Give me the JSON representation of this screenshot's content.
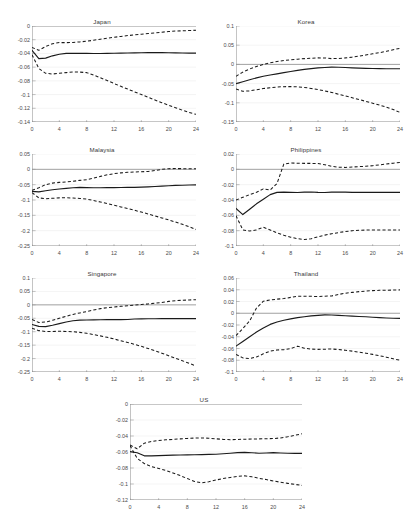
{
  "figure": {
    "layout": "3 rows of 2 panels plus 1 centered panel",
    "xlabel": "",
    "ylabel": "",
    "xticks": [
      0,
      4,
      8,
      12,
      16,
      20,
      24
    ],
    "xtick_labels": [
      "0",
      "4",
      "8",
      "12",
      "16",
      "20",
      "24"
    ],
    "line_styles": {
      "response": "solid",
      "confidence_bands": "dashed"
    },
    "colors": {
      "line": "#1a1a1a",
      "axis": "#7f7f7f",
      "grid": "#e9e9e9",
      "text": "#4a4a4a",
      "background": "#ffffff"
    }
  },
  "chart_data": [
    {
      "type": "line",
      "title": "Japan",
      "xlabel": "",
      "ylabel": "",
      "xlim": [
        0,
        24
      ],
      "ylim": [
        -0.14,
        0
      ],
      "yticks": [
        0,
        -0.02,
        -0.04,
        -0.06,
        -0.08,
        -0.1,
        -0.12,
        -0.14
      ],
      "ytick_labels": [
        "0",
        "-0.02",
        "-0.04",
        "-0.06",
        "-0.08",
        "-0.1",
        "-0.12",
        "-0.14"
      ],
      "grid": true,
      "legend": "none",
      "x": [
        0,
        1,
        2,
        3,
        4,
        5,
        6,
        7,
        8,
        9,
        10,
        11,
        12,
        13,
        14,
        15,
        16,
        17,
        18,
        19,
        20,
        21,
        22,
        23,
        24
      ],
      "series": [
        {
          "name": "Response",
          "style": "solid",
          "values": [
            -0.0355,
            -0.0475,
            -0.0468,
            -0.0435,
            -0.0412,
            -0.04,
            -0.0398,
            -0.0399,
            -0.04,
            -0.0401,
            -0.0401,
            -0.04,
            -0.0398,
            -0.0396,
            -0.0394,
            -0.0392,
            -0.039,
            -0.0389,
            -0.0388,
            -0.0389,
            -0.039,
            -0.0392,
            -0.0394,
            -0.0396,
            -0.0396
          ]
        },
        {
          "name": "Upper band",
          "style": "dashed",
          "values": [
            -0.0312,
            -0.0355,
            -0.03,
            -0.0258,
            -0.0242,
            -0.0243,
            -0.024,
            -0.0232,
            -0.0222,
            -0.0208,
            -0.0192,
            -0.0178,
            -0.0165,
            -0.0152,
            -0.014,
            -0.013,
            -0.012,
            -0.011,
            -0.01,
            -0.009,
            -0.008,
            -0.0074,
            -0.007,
            -0.0066,
            -0.0063
          ]
        },
        {
          "name": "Lower band",
          "style": "dashed",
          "values": [
            -0.042,
            -0.062,
            -0.069,
            -0.07,
            -0.069,
            -0.068,
            -0.067,
            -0.0672,
            -0.068,
            -0.0715,
            -0.0755,
            -0.0795,
            -0.0838,
            -0.088,
            -0.092,
            -0.096,
            -0.1,
            -0.104,
            -0.108,
            -0.1118,
            -0.1155,
            -0.1192,
            -0.1228,
            -0.1262,
            -0.1288
          ]
        }
      ]
    },
    {
      "type": "line",
      "title": "Korea",
      "xlabel": "",
      "ylabel": "",
      "xlim": [
        0,
        24
      ],
      "ylim": [
        -0.15,
        0.1
      ],
      "yticks": [
        0.1,
        0.05,
        0,
        -0.05,
        -0.1,
        -0.15
      ],
      "ytick_labels": [
        "0.1",
        "0.05",
        "0",
        "-0.05",
        "-0.1",
        "-0.15"
      ],
      "grid": true,
      "legend": "none",
      "x": [
        0,
        1,
        2,
        3,
        4,
        5,
        6,
        7,
        8,
        9,
        10,
        11,
        12,
        13,
        14,
        15,
        16,
        17,
        18,
        19,
        20,
        21,
        22,
        23,
        24
      ],
      "series": [
        {
          "name": "Response",
          "style": "solid",
          "values": [
            -0.05,
            -0.045,
            -0.04,
            -0.035,
            -0.031,
            -0.0275,
            -0.0245,
            -0.0215,
            -0.0185,
            -0.0155,
            -0.013,
            -0.011,
            -0.0092,
            -0.008,
            -0.0072,
            -0.0075,
            -0.0082,
            -0.009,
            -0.0098,
            -0.0104,
            -0.0108,
            -0.011,
            -0.0112,
            -0.0113,
            -0.0114
          ]
        },
        {
          "name": "Upper band",
          "style": "dashed",
          "values": [
            -0.031,
            -0.02,
            -0.012,
            -0.0055,
            0.0,
            0.004,
            0.0075,
            0.01,
            0.012,
            0.0135,
            0.015,
            0.016,
            0.017,
            0.0168,
            0.015,
            0.0155,
            0.017,
            0.019,
            0.0215,
            0.0245,
            0.0275,
            0.0305,
            0.034,
            0.038,
            0.042
          ]
        },
        {
          "name": "Lower band",
          "style": "dashed",
          "values": [
            -0.064,
            -0.07,
            -0.069,
            -0.066,
            -0.063,
            -0.0608,
            -0.059,
            -0.058,
            -0.0578,
            -0.0585,
            -0.06,
            -0.0625,
            -0.0655,
            -0.069,
            -0.073,
            -0.0775,
            -0.082,
            -0.0868,
            -0.0915,
            -0.0962,
            -0.101,
            -0.106,
            -0.1112,
            -0.1175,
            -0.125
          ]
        }
      ]
    },
    {
      "type": "line",
      "title": "Malaysia",
      "xlabel": "",
      "ylabel": "",
      "xlim": [
        0,
        24
      ],
      "ylim": [
        -0.25,
        0.05
      ],
      "yticks": [
        0.05,
        0,
        -0.05,
        -0.1,
        -0.15,
        -0.2,
        -0.25
      ],
      "ytick_labels": [
        "0.05",
        "0",
        "-0.05",
        "-0.1",
        "-0.15",
        "-0.2",
        "-0.25"
      ],
      "grid": true,
      "legend": "none",
      "x": [
        0,
        1,
        2,
        3,
        4,
        5,
        6,
        7,
        8,
        9,
        10,
        11,
        12,
        13,
        14,
        15,
        16,
        17,
        18,
        19,
        20,
        21,
        22,
        23,
        24
      ],
      "series": [
        {
          "name": "Response",
          "style": "solid",
          "values": [
            -0.072,
            -0.0735,
            -0.07,
            -0.0665,
            -0.064,
            -0.062,
            -0.06,
            -0.059,
            -0.0595,
            -0.06,
            -0.06,
            -0.0598,
            -0.0595,
            -0.0592,
            -0.059,
            -0.0588,
            -0.0582,
            -0.0572,
            -0.056,
            -0.0548,
            -0.0535,
            -0.0525,
            -0.0518,
            -0.0512,
            -0.0508
          ]
        },
        {
          "name": "Upper band",
          "style": "dashed",
          "values": [
            -0.068,
            -0.06,
            -0.05,
            -0.045,
            -0.0425,
            -0.041,
            -0.039,
            -0.036,
            -0.034,
            -0.029,
            -0.023,
            -0.018,
            -0.014,
            -0.0115,
            -0.0098,
            -0.0085,
            -0.008,
            -0.0068,
            -0.004,
            0.0,
            0.0022,
            0.0024,
            0.0022,
            0.0022,
            0.0022
          ]
        },
        {
          "name": "Lower band",
          "style": "dashed",
          "values": [
            -0.076,
            -0.093,
            -0.096,
            -0.0945,
            -0.093,
            -0.0928,
            -0.0935,
            -0.095,
            -0.097,
            -0.1015,
            -0.1065,
            -0.1115,
            -0.117,
            -0.1225,
            -0.128,
            -0.1335,
            -0.1395,
            -0.1455,
            -0.152,
            -0.1585,
            -0.165,
            -0.1718,
            -0.179,
            -0.187,
            -0.196
          ]
        }
      ]
    },
    {
      "type": "line",
      "title": "Philippines",
      "xlabel": "",
      "ylabel": "",
      "xlim": [
        0,
        24
      ],
      "ylim": [
        -0.1,
        0.02
      ],
      "yticks": [
        0.02,
        0,
        -0.02,
        -0.04,
        -0.06,
        -0.08,
        -0.1
      ],
      "ytick_labels": [
        "0.02",
        "0",
        "-0.02",
        "-0.04",
        "-0.06",
        "-0.08",
        "-0.1"
      ],
      "grid": true,
      "legend": "none",
      "x": [
        0,
        1,
        2,
        3,
        4,
        5,
        6,
        7,
        8,
        9,
        10,
        11,
        12,
        13,
        14,
        15,
        16,
        17,
        18,
        19,
        20,
        21,
        22,
        23,
        24
      ],
      "series": [
        {
          "name": "Response",
          "style": "solid",
          "values": [
            -0.051,
            -0.059,
            -0.052,
            -0.045,
            -0.039,
            -0.033,
            -0.03,
            -0.0298,
            -0.03,
            -0.0302,
            -0.0298,
            -0.0295,
            -0.03,
            -0.0302,
            -0.0298,
            -0.0296,
            -0.0298,
            -0.03,
            -0.03,
            -0.03,
            -0.03,
            -0.03,
            -0.03,
            -0.03,
            -0.03
          ]
        },
        {
          "name": "Upper band",
          "style": "dashed",
          "values": [
            -0.04,
            -0.0365,
            -0.033,
            -0.03,
            -0.0255,
            -0.027,
            -0.0185,
            0.007,
            0.0082,
            0.008,
            0.0078,
            0.0078,
            0.0075,
            0.006,
            0.004,
            0.0028,
            0.0025,
            0.003,
            0.0035,
            0.004,
            0.0048,
            0.0058,
            0.007,
            0.008,
            0.009
          ]
        },
        {
          "name": "Lower band",
          "style": "dashed",
          "values": [
            -0.0605,
            -0.079,
            -0.0805,
            -0.079,
            -0.0755,
            -0.079,
            -0.083,
            -0.086,
            -0.0885,
            -0.0905,
            -0.0915,
            -0.0905,
            -0.088,
            -0.0858,
            -0.084,
            -0.0825,
            -0.0812,
            -0.08,
            -0.0795,
            -0.0792,
            -0.079,
            -0.079,
            -0.079,
            -0.079,
            -0.079
          ]
        }
      ]
    },
    {
      "type": "line",
      "title": "Singapore",
      "xlabel": "",
      "ylabel": "",
      "xlim": [
        0,
        24
      ],
      "ylim": [
        -0.25,
        0.1
      ],
      "yticks": [
        0.1,
        0.05,
        0,
        -0.05,
        -0.1,
        -0.15,
        -0.2,
        -0.25
      ],
      "ytick_labels": [
        "0.1",
        "0.05",
        "0",
        "-0.05",
        "-0.1",
        "-0.15",
        "-0.2",
        "-0.25"
      ],
      "grid": true,
      "legend": "none",
      "x": [
        0,
        1,
        2,
        3,
        4,
        5,
        6,
        7,
        8,
        9,
        10,
        11,
        12,
        13,
        14,
        15,
        16,
        17,
        18,
        19,
        20,
        21,
        22,
        23,
        24
      ],
      "series": [
        {
          "name": "Response",
          "style": "solid",
          "values": [
            -0.073,
            -0.08,
            -0.081,
            -0.076,
            -0.07,
            -0.064,
            -0.059,
            -0.057,
            -0.0562,
            -0.0558,
            -0.0555,
            -0.0552,
            -0.055,
            -0.0548,
            -0.0545,
            -0.0525,
            -0.052,
            -0.0518,
            -0.0516,
            -0.0514,
            -0.0512,
            -0.051,
            -0.051,
            -0.051,
            -0.051
          ]
        },
        {
          "name": "Upper band",
          "style": "dashed",
          "values": [
            -0.054,
            -0.066,
            -0.064,
            -0.0575,
            -0.05,
            -0.0425,
            -0.0355,
            -0.03,
            -0.025,
            -0.019,
            -0.014,
            -0.0105,
            -0.0078,
            -0.0055,
            -0.0035,
            -0.0012,
            0.001,
            0.0035,
            0.006,
            0.0085,
            0.013,
            0.0155,
            0.017,
            0.0182,
            0.0192
          ]
        },
        {
          "name": "Lower band",
          "style": "dashed",
          "values": [
            -0.087,
            -0.096,
            -0.0995,
            -0.099,
            -0.0985,
            -0.099,
            -0.1,
            -0.1025,
            -0.106,
            -0.1105,
            -0.1155,
            -0.121,
            -0.127,
            -0.1335,
            -0.14,
            -0.147,
            -0.1545,
            -0.1625,
            -0.171,
            -0.18,
            -0.1895,
            -0.199,
            -0.208,
            -0.2175,
            -0.2275
          ]
        }
      ]
    },
    {
      "type": "line",
      "title": "Thailand",
      "xlabel": "",
      "ylabel": "",
      "xlim": [
        -0.1,
        0.06
      ],
      "ylim": [
        -0.1,
        0.06
      ],
      "yticks": [
        0.06,
        0.04,
        0.02,
        0,
        -0.02,
        -0.04,
        -0.06,
        -0.08,
        -0.1
      ],
      "ytick_labels": [
        "0.06",
        "0.04",
        "0.02",
        "0",
        "-0.02",
        "-0.04",
        "-0.06",
        "-0.08",
        "-0.1"
      ],
      "grid": true,
      "legend": "none",
      "x": [
        0,
        1,
        2,
        3,
        4,
        5,
        6,
        7,
        8,
        9,
        10,
        11,
        12,
        13,
        14,
        15,
        16,
        17,
        18,
        19,
        20,
        21,
        22,
        23,
        24
      ],
      "series": [
        {
          "name": "Response",
          "style": "solid",
          "values": [
            -0.056,
            -0.048,
            -0.04,
            -0.032,
            -0.025,
            -0.019,
            -0.015,
            -0.012,
            -0.0095,
            -0.0075,
            -0.006,
            -0.0045,
            -0.0035,
            -0.0028,
            -0.003,
            -0.0035,
            -0.0042,
            -0.0048,
            -0.0055,
            -0.006,
            -0.0068,
            -0.0075,
            -0.008,
            -0.0085,
            -0.0088
          ]
        },
        {
          "name": "Upper band",
          "style": "dashed",
          "values": [
            -0.038,
            -0.026,
            -0.013,
            0.009,
            0.0205,
            0.0225,
            0.024,
            0.025,
            0.027,
            0.0288,
            0.029,
            0.0288,
            0.0285,
            0.029,
            0.0295,
            0.032,
            0.034,
            0.0355,
            0.0368,
            0.0378,
            0.0385,
            0.039,
            0.0392,
            0.0395,
            0.0398
          ]
        },
        {
          "name": "Lower band",
          "style": "dashed",
          "values": [
            -0.07,
            -0.076,
            -0.0772,
            -0.0745,
            -0.069,
            -0.0645,
            -0.0625,
            -0.062,
            -0.06,
            -0.056,
            -0.0595,
            -0.061,
            -0.0615,
            -0.0612,
            -0.0608,
            -0.0618,
            -0.063,
            -0.0645,
            -0.0662,
            -0.068,
            -0.07,
            -0.0722,
            -0.0748,
            -0.0775,
            -0.08
          ]
        }
      ]
    },
    {
      "type": "line",
      "title": "US",
      "xlabel": "",
      "ylabel": "",
      "xlim": [
        0,
        24
      ],
      "ylim": [
        -0.12,
        0
      ],
      "yticks": [
        0,
        -0.02,
        -0.04,
        -0.06,
        -0.08,
        -0.1,
        -0.12
      ],
      "ytick_labels": [
        "0",
        "-0.02",
        "-0.04",
        "-0.06",
        "-0.08",
        "-0.1",
        "-0.12"
      ],
      "grid": true,
      "legend": "none",
      "x": [
        0,
        1,
        2,
        3,
        4,
        5,
        6,
        7,
        8,
        9,
        10,
        11,
        12,
        13,
        14,
        15,
        16,
        17,
        18,
        19,
        20,
        21,
        22,
        23,
        24
      ],
      "series": [
        {
          "name": "Response",
          "style": "solid",
          "values": [
            -0.0595,
            -0.061,
            -0.0648,
            -0.0648,
            -0.0645,
            -0.0642,
            -0.064,
            -0.0638,
            -0.0636,
            -0.0634,
            -0.0632,
            -0.063,
            -0.0628,
            -0.0622,
            -0.0615,
            -0.0608,
            -0.0605,
            -0.061,
            -0.0615,
            -0.0612,
            -0.0608,
            -0.0612,
            -0.0616,
            -0.0618,
            -0.0618
          ]
        },
        {
          "name": "Upper band",
          "style": "dashed",
          "values": [
            -0.0512,
            -0.056,
            -0.049,
            -0.0468,
            -0.0455,
            -0.0448,
            -0.0442,
            -0.0436,
            -0.043,
            -0.0426,
            -0.0424,
            -0.0428,
            -0.0435,
            -0.0442,
            -0.0446,
            -0.0443,
            -0.044,
            -0.0438,
            -0.0436,
            -0.0434,
            -0.0432,
            -0.0424,
            -0.041,
            -0.0392,
            -0.0372
          ]
        },
        {
          "name": "Lower band",
          "style": "dashed",
          "values": [
            -0.052,
            -0.068,
            -0.0745,
            -0.0782,
            -0.0805,
            -0.0832,
            -0.0862,
            -0.0895,
            -0.0932,
            -0.0968,
            -0.0985,
            -0.0972,
            -0.095,
            -0.0932,
            -0.0918,
            -0.0905,
            -0.0898,
            -0.091,
            -0.0928,
            -0.0945,
            -0.0962,
            -0.0978,
            -0.0992,
            -0.1005,
            -0.1018
          ]
        }
      ]
    }
  ]
}
